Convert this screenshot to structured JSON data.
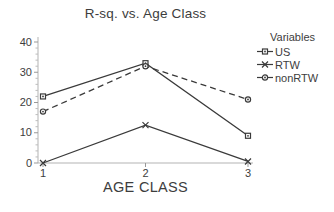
{
  "chart_data": {
    "type": "line",
    "title": "R-sq. vs. Age Class",
    "xlabel": "AGE CLASS",
    "ylabel": "",
    "x": [
      1,
      2,
      3
    ],
    "xticks": [
      "1",
      "2",
      "3"
    ],
    "yticks": [
      0,
      10,
      20,
      30,
      40
    ],
    "ylim": [
      0,
      40
    ],
    "y_minor_step": 2,
    "grid": false,
    "legend_position": "right",
    "legend_title": "Variables",
    "series": [
      {
        "name": "US",
        "values": [
          22,
          33,
          9
        ],
        "marker": "square",
        "line_style": "solid",
        "color": "#3a3a3a"
      },
      {
        "name": "RTW",
        "values": [
          0,
          12.5,
          0.5
        ],
        "marker": "x",
        "line_style": "solid",
        "color": "#3a3a3a"
      },
      {
        "name": "nonRTW",
        "values": [
          17,
          32,
          21
        ],
        "marker": "circle",
        "line_style": "dashed",
        "color": "#3a3a3a"
      }
    ]
  },
  "colors": {
    "background": "#ffffff",
    "text": "#3d3d3d",
    "series_line": "#3a3a3a",
    "axis_line": "#b3b3b3",
    "major_tick": "#999999",
    "minor_tick": "#bdbdbd"
  }
}
